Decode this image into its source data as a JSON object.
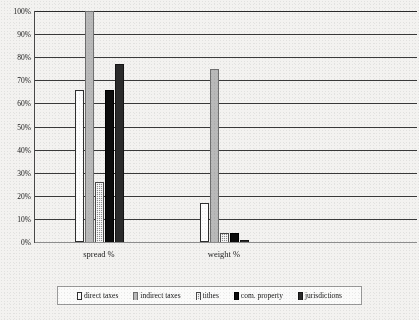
{
  "chart_data": {
    "type": "bar",
    "title": "",
    "subtitle": "",
    "xlabel": "",
    "ylabel": "",
    "categories": [
      "spread %",
      "weight %"
    ],
    "series": [
      {
        "name": "direct taxes",
        "values": [
          66,
          17
        ],
        "swatch_color": "#ffffff"
      },
      {
        "name": "indirect taxes",
        "values": [
          100,
          75
        ],
        "swatch_color": "#b9b9b9"
      },
      {
        "name": "tithes",
        "values": [
          26,
          4
        ],
        "swatch_color": "#8e8e8e"
      },
      {
        "name": "com. property",
        "values": [
          66,
          4
        ],
        "swatch_color": "#0c0c0c"
      },
      {
        "name": "jurisdictions",
        "values": [
          77,
          1
        ],
        "swatch_color": "#2b2b2b"
      }
    ],
    "ylim": [
      0,
      100
    ],
    "y_ticks": [
      "0%",
      "10%",
      "20%",
      "30%",
      "40%",
      "50%",
      "60%",
      "70%",
      "80%",
      "90%",
      "100%"
    ],
    "y_tick_values": [
      0,
      10,
      20,
      30,
      40,
      50,
      60,
      70,
      80,
      90,
      100
    ],
    "grid": true,
    "grid_axis": "y",
    "legend_position": "bottom",
    "legend_entries": [
      "direct taxes",
      "indirect taxes",
      "tithes",
      "com. property",
      "jurisdictions"
    ]
  }
}
